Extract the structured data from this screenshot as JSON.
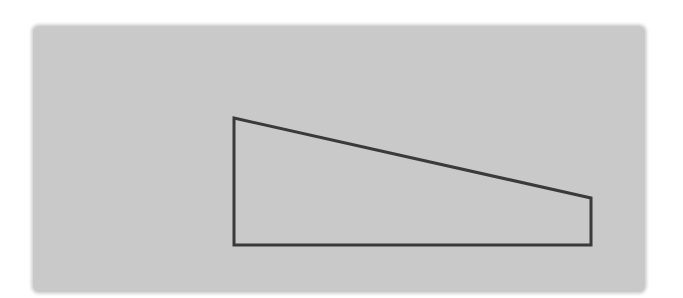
{
  "diagram": {
    "background_color": "#c9c9c9",
    "stroke_color": "#3a3a3a",
    "shape": {
      "type": "right-trapezoid",
      "vertices": [
        [
          234,
          118
        ],
        [
          591,
          198
        ],
        [
          591,
          245
        ],
        [
          234,
          245
        ]
      ],
      "stroke_width": 3
    }
  }
}
